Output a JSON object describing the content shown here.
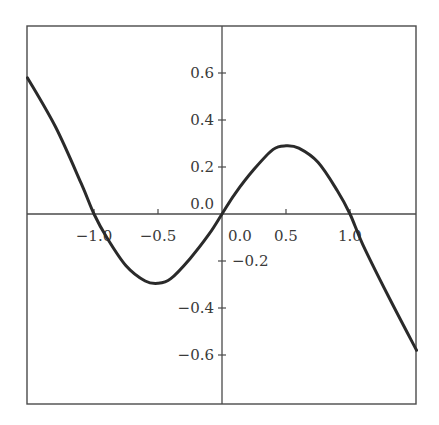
{
  "chart_data": {
    "type": "line",
    "title": "",
    "xlabel": "",
    "ylabel": "",
    "xlim": [
      -1.52,
      1.52
    ],
    "ylim": [
      -0.8,
      0.8
    ],
    "grid": false,
    "legend": null,
    "axes_through_origin": true,
    "x_ticks": [
      {
        "value": -1.0,
        "label": "−1.0"
      },
      {
        "value": -0.5,
        "label": "−0.5"
      },
      {
        "value": 0.0,
        "label": "0.0"
      },
      {
        "value": 0.5,
        "label": "0.5"
      },
      {
        "value": 1.0,
        "label": "1.0"
      }
    ],
    "y_ticks": [
      {
        "value": 0.6,
        "label": "0.6"
      },
      {
        "value": 0.4,
        "label": "0.4"
      },
      {
        "value": 0.2,
        "label": "0.2"
      },
      {
        "value": 0.0,
        "label": "0.0"
      },
      {
        "value": -0.2,
        "label": "−0.2"
      },
      {
        "value": -0.4,
        "label": "−0.4"
      },
      {
        "value": -0.6,
        "label": "−0.6"
      }
    ],
    "series": [
      {
        "name": "f(x)",
        "color": "#2a2a2a",
        "x": [
          -1.52,
          -1.3,
          -1.1,
          -1.0,
          -0.9,
          -0.75,
          -0.6,
          -0.5,
          -0.4,
          -0.25,
          -0.1,
          0.0,
          0.1,
          0.25,
          0.4,
          0.5,
          0.6,
          0.75,
          0.9,
          1.0,
          1.1,
          1.3,
          1.52
        ],
        "y": [
          0.58,
          0.37,
          0.13,
          0.0,
          -0.1,
          -0.22,
          -0.285,
          -0.295,
          -0.275,
          -0.19,
          -0.085,
          0.0,
          0.085,
          0.19,
          0.275,
          0.29,
          0.28,
          0.22,
          0.1,
          0.0,
          -0.13,
          -0.35,
          -0.58
        ]
      }
    ]
  }
}
